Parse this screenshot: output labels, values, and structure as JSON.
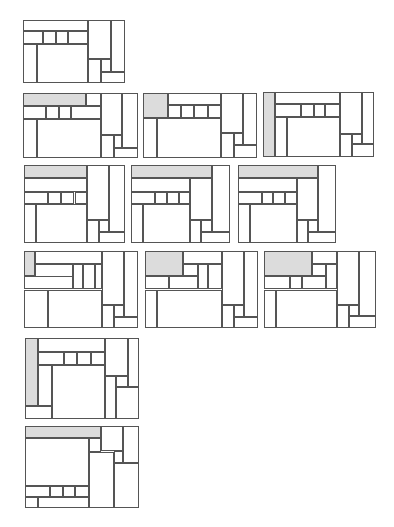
{
  "diagram": {
    "title": "",
    "colors": {
      "stroke": "#555555",
      "fill": "#ffffff",
      "shaded": "#dcdcdc"
    },
    "panels": [
      {
        "id": "p1",
        "x": 23,
        "y": 20,
        "w": 102,
        "h": 63,
        "rects": [
          [
            0,
            0,
            64,
            18,
            0
          ],
          [
            0,
            18,
            20,
            20,
            0
          ],
          [
            20,
            18,
            12,
            20,
            0
          ],
          [
            32,
            18,
            12,
            20,
            0
          ],
          [
            44,
            18,
            20,
            20,
            0
          ],
          [
            0,
            38,
            14,
            62,
            0
          ],
          [
            14,
            38,
            50,
            62,
            0
          ],
          [
            64,
            0,
            22,
            62,
            0
          ],
          [
            86,
            0,
            14,
            82,
            0
          ],
          [
            64,
            62,
            12,
            38,
            0
          ],
          [
            76,
            62,
            10,
            20,
            0
          ],
          [
            76,
            82,
            24,
            18,
            0
          ]
        ]
      },
      {
        "id": "p2",
        "x": 23,
        "y": 93,
        "w": 115,
        "h": 65,
        "rects": [
          [
            0,
            0,
            55,
            20,
            1
          ],
          [
            55,
            0,
            13,
            20,
            0
          ],
          [
            0,
            20,
            20,
            20,
            0
          ],
          [
            20,
            20,
            11,
            20,
            0
          ],
          [
            31,
            20,
            11,
            20,
            0
          ],
          [
            42,
            20,
            26,
            20,
            0
          ],
          [
            0,
            40,
            12,
            60,
            0
          ],
          [
            12,
            40,
            56,
            60,
            0
          ],
          [
            68,
            0,
            18,
            64,
            0
          ],
          [
            86,
            0,
            14,
            84,
            0
          ],
          [
            68,
            64,
            11,
            36,
            0
          ],
          [
            79,
            64,
            7,
            20,
            0
          ],
          [
            79,
            84,
            21,
            16,
            0
          ]
        ]
      },
      {
        "id": "p3",
        "x": 143,
        "y": 93,
        "w": 114,
        "h": 65,
        "rects": [
          [
            0,
            0,
            22,
            38,
            1
          ],
          [
            22,
            0,
            46,
            18,
            0
          ],
          [
            22,
            18,
            11,
            20,
            0
          ],
          [
            33,
            18,
            12,
            20,
            0
          ],
          [
            45,
            18,
            12,
            20,
            0
          ],
          [
            57,
            18,
            11,
            20,
            0
          ],
          [
            0,
            38,
            12,
            62,
            0
          ],
          [
            12,
            38,
            56,
            62,
            0
          ],
          [
            68,
            0,
            20,
            62,
            0
          ],
          [
            88,
            0,
            12,
            80,
            0
          ],
          [
            68,
            62,
            12,
            38,
            0
          ],
          [
            80,
            62,
            8,
            18,
            0
          ],
          [
            80,
            80,
            20,
            20,
            0
          ]
        ]
      },
      {
        "id": "p4",
        "x": 263,
        "y": 92,
        "w": 111,
        "h": 65,
        "rects": [
          [
            0,
            0,
            11,
            100,
            1
          ],
          [
            11,
            0,
            58,
            18,
            0
          ],
          [
            11,
            18,
            23,
            20,
            0
          ],
          [
            34,
            18,
            12,
            20,
            0
          ],
          [
            46,
            18,
            10,
            20,
            0
          ],
          [
            56,
            18,
            13,
            20,
            0
          ],
          [
            11,
            38,
            11,
            62,
            0
          ],
          [
            22,
            38,
            47,
            62,
            0
          ],
          [
            69,
            0,
            20,
            64,
            0
          ],
          [
            89,
            0,
            11,
            80,
            0
          ],
          [
            69,
            64,
            11,
            36,
            0
          ],
          [
            80,
            64,
            9,
            16,
            0
          ],
          [
            80,
            80,
            20,
            20,
            0
          ]
        ]
      },
      {
        "id": "p5",
        "x": 24,
        "y": 165,
        "w": 101,
        "h": 78,
        "rects": [
          [
            0,
            0,
            62,
            17,
            1
          ],
          [
            0,
            17,
            62,
            17,
            0
          ],
          [
            0,
            34,
            24,
            16,
            0
          ],
          [
            24,
            34,
            13,
            16,
            0
          ],
          [
            37,
            34,
            13,
            16,
            0
          ],
          [
            50,
            34,
            12,
            16,
            0
          ],
          [
            0,
            50,
            12,
            50,
            0
          ],
          [
            12,
            50,
            50,
            50,
            0
          ],
          [
            62,
            0,
            22,
            70,
            0
          ],
          [
            84,
            0,
            16,
            86,
            0
          ],
          [
            62,
            70,
            12,
            30,
            0
          ],
          [
            74,
            70,
            10,
            16,
            0
          ],
          [
            74,
            86,
            26,
            14,
            0
          ]
        ]
      },
      {
        "id": "p6",
        "x": 131,
        "y": 165,
        "w": 99,
        "h": 78,
        "rects": [
          [
            0,
            0,
            82,
            17,
            1
          ],
          [
            82,
            0,
            18,
            86,
            0
          ],
          [
            0,
            17,
            60,
            17,
            0
          ],
          [
            60,
            17,
            22,
            53,
            0
          ],
          [
            0,
            34,
            24,
            16,
            0
          ],
          [
            24,
            34,
            12,
            16,
            0
          ],
          [
            36,
            34,
            12,
            16,
            0
          ],
          [
            48,
            34,
            12,
            16,
            0
          ],
          [
            0,
            50,
            12,
            50,
            0
          ],
          [
            12,
            50,
            48,
            50,
            0
          ],
          [
            60,
            70,
            11,
            30,
            0
          ],
          [
            71,
            70,
            11,
            16,
            0
          ],
          [
            71,
            86,
            29,
            14,
            0
          ]
        ]
      },
      {
        "id": "p7",
        "x": 238,
        "y": 165,
        "w": 98,
        "h": 78,
        "rects": [
          [
            0,
            0,
            82,
            17,
            1
          ],
          [
            82,
            0,
            18,
            86,
            0
          ],
          [
            0,
            17,
            60,
            17,
            0
          ],
          [
            60,
            17,
            22,
            53,
            0
          ],
          [
            0,
            34,
            24,
            16,
            0
          ],
          [
            24,
            34,
            12,
            16,
            0
          ],
          [
            36,
            34,
            12,
            16,
            0
          ],
          [
            48,
            34,
            12,
            16,
            0
          ],
          [
            0,
            50,
            12,
            50,
            0
          ],
          [
            12,
            50,
            48,
            50,
            0
          ],
          [
            60,
            70,
            11,
            30,
            0
          ],
          [
            71,
            70,
            11,
            16,
            0
          ],
          [
            71,
            86,
            29,
            14,
            0
          ]
        ]
      },
      {
        "id": "p8",
        "x": 24,
        "y": 251,
        "w": 114,
        "h": 77,
        "rects": [
          [
            0,
            0,
            10,
            32,
            1
          ],
          [
            10,
            0,
            58,
            17,
            0
          ],
          [
            10,
            17,
            33,
            33,
            0
          ],
          [
            43,
            17,
            9,
            33,
            0
          ],
          [
            52,
            17,
            10,
            33,
            0
          ],
          [
            62,
            17,
            6,
            33,
            0
          ],
          [
            0,
            32,
            43,
            18,
            0
          ],
          [
            0,
            50,
            21,
            50,
            0
          ],
          [
            21,
            50,
            47,
            50,
            0
          ],
          [
            68,
            0,
            20,
            70,
            0
          ],
          [
            88,
            0,
            12,
            86,
            0
          ],
          [
            68,
            70,
            11,
            30,
            0
          ],
          [
            79,
            70,
            9,
            16,
            0
          ],
          [
            79,
            86,
            21,
            14,
            0
          ]
        ]
      },
      {
        "id": "p9",
        "x": 145,
        "y": 251,
        "w": 113,
        "h": 77,
        "rects": [
          [
            0,
            0,
            34,
            32,
            1
          ],
          [
            34,
            0,
            34,
            17,
            0
          ],
          [
            34,
            17,
            13,
            16,
            0
          ],
          [
            47,
            17,
            9,
            33,
            0
          ],
          [
            56,
            17,
            12,
            33,
            0
          ],
          [
            0,
            32,
            21,
            18,
            0
          ],
          [
            21,
            32,
            26,
            18,
            0
          ],
          [
            0,
            50,
            11,
            50,
            0
          ],
          [
            11,
            50,
            57,
            50,
            0
          ],
          [
            68,
            0,
            20,
            70,
            0
          ],
          [
            88,
            0,
            12,
            86,
            0
          ],
          [
            68,
            70,
            11,
            30,
            0
          ],
          [
            79,
            70,
            9,
            16,
            0
          ],
          [
            79,
            86,
            21,
            14,
            0
          ]
        ]
      },
      {
        "id": "p10",
        "x": 264,
        "y": 251,
        "w": 112,
        "h": 77,
        "rects": [
          [
            0,
            0,
            43,
            32,
            1
          ],
          [
            43,
            0,
            22,
            17,
            0
          ],
          [
            43,
            17,
            12,
            16,
            0
          ],
          [
            55,
            17,
            10,
            33,
            0
          ],
          [
            0,
            32,
            23,
            18,
            0
          ],
          [
            23,
            32,
            11,
            18,
            0
          ],
          [
            34,
            32,
            21,
            18,
            0
          ],
          [
            0,
            50,
            11,
            50,
            0
          ],
          [
            11,
            50,
            54,
            50,
            0
          ],
          [
            65,
            0,
            20,
            70,
            0
          ],
          [
            85,
            0,
            15,
            84,
            0
          ],
          [
            65,
            70,
            11,
            30,
            0
          ],
          [
            76,
            70,
            9,
            14,
            0
          ],
          [
            76,
            84,
            24,
            16,
            0
          ]
        ]
      },
      {
        "id": "p11",
        "x": 25,
        "y": 338,
        "w": 114,
        "h": 81,
        "rects": [
          [
            0,
            0,
            11,
            84,
            1
          ],
          [
            11,
            0,
            59,
            17,
            0
          ],
          [
            11,
            17,
            23,
            16,
            0
          ],
          [
            34,
            17,
            12,
            16,
            0
          ],
          [
            46,
            17,
            12,
            16,
            0
          ],
          [
            58,
            17,
            12,
            16,
            0
          ],
          [
            11,
            33,
            13,
            51,
            0
          ],
          [
            24,
            33,
            46,
            67,
            0
          ],
          [
            0,
            84,
            24,
            16,
            0
          ],
          [
            70,
            0,
            20,
            47,
            0
          ],
          [
            90,
            0,
            10,
            60,
            0
          ],
          [
            70,
            47,
            10,
            53,
            0
          ],
          [
            80,
            47,
            10,
            13,
            0
          ],
          [
            80,
            60,
            20,
            40,
            0
          ]
        ]
      },
      {
        "id": "p12",
        "x": 25,
        "y": 426,
        "w": 114,
        "h": 82,
        "rects": [
          [
            0,
            0,
            67,
            15,
            1
          ],
          [
            67,
            0,
            19,
            31,
            0
          ],
          [
            86,
            0,
            14,
            45,
            0
          ],
          [
            0,
            15,
            56,
            58,
            0
          ],
          [
            56,
            15,
            11,
            17,
            0
          ],
          [
            56,
            32,
            22,
            68,
            0
          ],
          [
            78,
            31,
            8,
            14,
            0
          ],
          [
            78,
            45,
            22,
            55,
            0
          ],
          [
            0,
            73,
            22,
            13,
            0
          ],
          [
            22,
            73,
            11,
            13,
            0
          ],
          [
            33,
            73,
            11,
            13,
            0
          ],
          [
            44,
            73,
            12,
            13,
            0
          ],
          [
            0,
            86,
            11,
            14,
            0
          ],
          [
            11,
            86,
            45,
            14,
            0
          ]
        ]
      }
    ]
  }
}
